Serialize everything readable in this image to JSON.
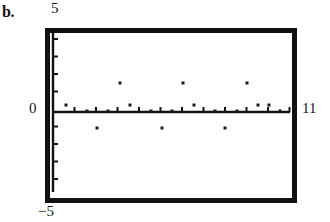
{
  "figure": {
    "panel_label": "b.",
    "labels": {
      "y_max": "5",
      "y_min": "−5",
      "y_zero": "0",
      "x_max": "11"
    }
  },
  "chart_data": {
    "type": "scatter",
    "title": "",
    "subtitle": "",
    "xlabel": "",
    "ylabel": "",
    "xlim": [
      0,
      11
    ],
    "ylim": [
      -5,
      5
    ],
    "grid": false,
    "legend": null,
    "axis_style": "calculator-window",
    "frame": {
      "left_px": 45,
      "top_px": 28,
      "right_px": 297,
      "bottom_px": 203,
      "line_width_px": 5,
      "color": "#111111"
    },
    "x_axis": {
      "y_value": 0,
      "y_px": 112,
      "x_start_px": 53,
      "x_end_px": 290,
      "tick_count": 11,
      "tick_values": [
        1,
        2,
        3,
        4,
        5,
        6,
        7,
        8,
        9,
        10,
        11
      ],
      "tick_spacing_px": 21.5,
      "tick_length_px": 5,
      "labels_shown": false
    },
    "y_axis": {
      "x_value": 0,
      "x_px": 53,
      "y_start_px": 33,
      "y_end_px": 192,
      "tick_count": 10,
      "tick_values": [
        -4,
        -3,
        -2,
        -1,
        1,
        2,
        3,
        4
      ],
      "tick_spacing_px": 17.5,
      "tick_length_px": 5,
      "labels_shown": false
    },
    "points": [
      {
        "x": 1,
        "y": 0.2,
        "px": 66,
        "py": 105
      },
      {
        "x": 1.6,
        "y": -1.0,
        "px": 97,
        "py": 128
      },
      {
        "x": 2,
        "y": 0.0,
        "px": 87,
        "py": 111
      },
      {
        "x": 2.6,
        "y": 1.0,
        "px": 120,
        "py": 83
      },
      {
        "x": 3,
        "y": 0.0,
        "px": 108,
        "py": 111
      },
      {
        "x": 4,
        "y": 0.2,
        "px": 130,
        "py": 105
      },
      {
        "x": 5,
        "y": 0.0,
        "px": 151,
        "py": 111
      },
      {
        "x": 5.2,
        "y": -1.0,
        "px": 162,
        "py": 128
      },
      {
        "x": 6,
        "y": 0.0,
        "px": 172,
        "py": 111
      },
      {
        "x": 6.5,
        "y": 1.0,
        "px": 183,
        "py": 83
      },
      {
        "x": 7,
        "y": 0.2,
        "px": 194,
        "py": 105
      },
      {
        "x": 8,
        "y": 0.0,
        "px": 215,
        "py": 111
      },
      {
        "x": 8.4,
        "y": -1.0,
        "px": 225,
        "py": 128
      },
      {
        "x": 9,
        "y": 0.0,
        "px": 237,
        "py": 111
      },
      {
        "x": 9.4,
        "y": 1.0,
        "px": 247,
        "py": 83
      },
      {
        "x": 10,
        "y": 0.2,
        "px": 258,
        "py": 105
      },
      {
        "x": 10.5,
        "y": 0.2,
        "px": 269,
        "py": 105
      },
      {
        "x": 11,
        "y": 0.0,
        "px": 280,
        "py": 111
      }
    ],
    "point_style": {
      "marker": "square",
      "size_px": 3,
      "color": "#1a1a1a"
    }
  }
}
